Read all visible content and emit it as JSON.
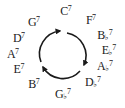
{
  "diagram": {
    "direction": "clockwise",
    "chords": [
      {
        "root": "C",
        "accidental": "",
        "extension": "7"
      },
      {
        "root": "F",
        "accidental": "",
        "extension": "7"
      },
      {
        "root": "B",
        "accidental": "♭",
        "extension": "7"
      },
      {
        "root": "E",
        "accidental": "♭",
        "extension": "7"
      },
      {
        "root": "A",
        "accidental": "♭",
        "extension": "7"
      },
      {
        "root": "D",
        "accidental": "♭",
        "extension": "7"
      },
      {
        "root": "G",
        "accidental": "♭",
        "extension": "7"
      },
      {
        "root": "B",
        "accidental": "",
        "extension": "7"
      },
      {
        "root": "E",
        "accidental": "",
        "extension": "7"
      },
      {
        "root": "A",
        "accidental": "",
        "extension": "7"
      },
      {
        "root": "D",
        "accidental": "",
        "extension": "7"
      },
      {
        "root": "G",
        "accidental": "",
        "extension": "7"
      }
    ],
    "arrow_count": 3,
    "colors": {
      "text": "#1a1a1a",
      "arrow": "#1a1a1a",
      "background": "#ffffff"
    }
  }
}
